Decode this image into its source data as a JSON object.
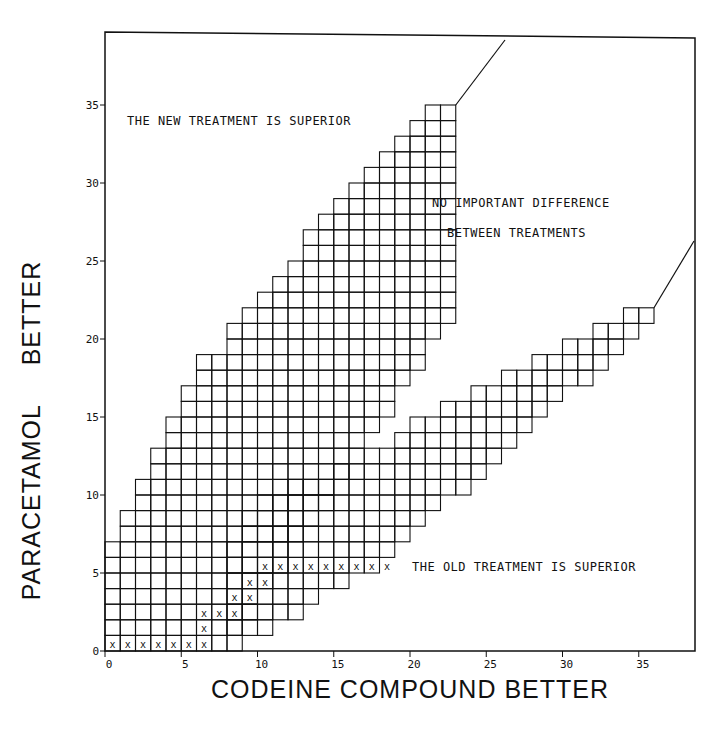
{
  "chart_data": {
    "type": "sequential-boundary-grid",
    "title": "",
    "xlabel": "CODEINE COMPOUND BETTER",
    "ylabel": "PARACETAMOL     BETTER",
    "xlim": [
      0,
      38
    ],
    "ylim": [
      0,
      38
    ],
    "x_ticks": [
      0,
      5,
      10,
      15,
      20,
      25,
      30,
      35
    ],
    "x_tick_labels": [
      "0",
      "5",
      "10",
      "15",
      "20",
      "25",
      "30",
      "35"
    ],
    "y_ticks": [
      0,
      5,
      10,
      15,
      20,
      25,
      30,
      35
    ],
    "y_tick_labels": [
      "0",
      "5",
      "10",
      "15",
      "20",
      "25",
      "30",
      "35"
    ],
    "grid": "cells inside continuation region only",
    "annotations": [
      {
        "text": "THE NEW TREATMENT IS SUPERIOR",
        "region": "upper-left"
      },
      {
        "text": "NO IMPORTANT DIFFERENCE",
        "region": "middle"
      },
      {
        "text": "BETWEEN TREATMENTS",
        "region": "middle"
      },
      {
        "text": "THE OLD TREATMENT IS SUPERIOR",
        "region": "lower-right"
      }
    ],
    "upper_boundary_top_cell_per_column": [
      7,
      9,
      11,
      13,
      15,
      17,
      19,
      19,
      21,
      22,
      23,
      24,
      25,
      27,
      28,
      29,
      30,
      31,
      32,
      33,
      34,
      35,
      35
    ],
    "upper_boundary_bottom_cell_per_column": [
      0,
      0,
      0,
      0,
      0,
      0,
      0,
      0,
      1,
      2,
      4,
      5,
      7,
      8,
      9,
      11,
      12,
      14,
      15,
      17,
      18,
      20,
      21
    ],
    "lower_wedge_columns": [
      {
        "x": 8,
        "bottom": 0,
        "top": 7
      },
      {
        "x": 9,
        "bottom": 1,
        "top": 9
      },
      {
        "x": 10,
        "bottom": 1,
        "top": 10
      },
      {
        "x": 11,
        "bottom": 2,
        "top": 10
      },
      {
        "x": 12,
        "bottom": 2,
        "top": 11
      },
      {
        "x": 13,
        "bottom": 3,
        "top": 11
      },
      {
        "x": 14,
        "bottom": 4,
        "top": 11
      },
      {
        "x": 15,
        "bottom": 4,
        "top": 12
      },
      {
        "x": 16,
        "bottom": 5,
        "top": 12
      },
      {
        "x": 17,
        "bottom": 5,
        "top": 13
      },
      {
        "x": 18,
        "bottom": 6,
        "top": 13
      },
      {
        "x": 19,
        "bottom": 7,
        "top": 14
      },
      {
        "x": 20,
        "bottom": 8,
        "top": 15
      },
      {
        "x": 21,
        "bottom": 9,
        "top": 15
      },
      {
        "x": 22,
        "bottom": 10,
        "top": 16
      },
      {
        "x": 23,
        "bottom": 10,
        "top": 16
      },
      {
        "x": 24,
        "bottom": 11,
        "top": 17
      },
      {
        "x": 25,
        "bottom": 12,
        "top": 17
      },
      {
        "x": 26,
        "bottom": 13,
        "top": 18
      },
      {
        "x": 27,
        "bottom": 14,
        "top": 18
      },
      {
        "x": 28,
        "bottom": 15,
        "top": 19
      },
      {
        "x": 29,
        "bottom": 16,
        "top": 19
      },
      {
        "x": 30,
        "bottom": 17,
        "top": 20
      },
      {
        "x": 31,
        "bottom": 17,
        "top": 20
      },
      {
        "x": 32,
        "bottom": 18,
        "top": 21
      },
      {
        "x": 33,
        "bottom": 19,
        "top": 21
      },
      {
        "x": 34,
        "bottom": 20,
        "top": 22
      },
      {
        "x": 35,
        "bottom": 21,
        "top": 22
      }
    ],
    "path_points_marked_x": [
      [
        0,
        0
      ],
      [
        1,
        0
      ],
      [
        2,
        0
      ],
      [
        3,
        0
      ],
      [
        4,
        0
      ],
      [
        5,
        0
      ],
      [
        6,
        0
      ],
      [
        6,
        1
      ],
      [
        6,
        2
      ],
      [
        7,
        2
      ],
      [
        8,
        2
      ],
      [
        8,
        3
      ],
      [
        9,
        3
      ],
      [
        9,
        4
      ],
      [
        10,
        4
      ],
      [
        10,
        5
      ],
      [
        11,
        5
      ],
      [
        12,
        5
      ],
      [
        13,
        5
      ],
      [
        14,
        5
      ],
      [
        15,
        5
      ],
      [
        16,
        5
      ],
      [
        17,
        5
      ],
      [
        18,
        5
      ]
    ],
    "upper_extension_line": {
      "from": [
        23,
        35
      ],
      "to": [
        30,
        39
      ]
    },
    "lower_extension_line": {
      "from": [
        36,
        22
      ],
      "to": [
        38.5,
        26
      ]
    },
    "colors": {
      "ink": "#111111",
      "paper": "#ffffff"
    }
  }
}
